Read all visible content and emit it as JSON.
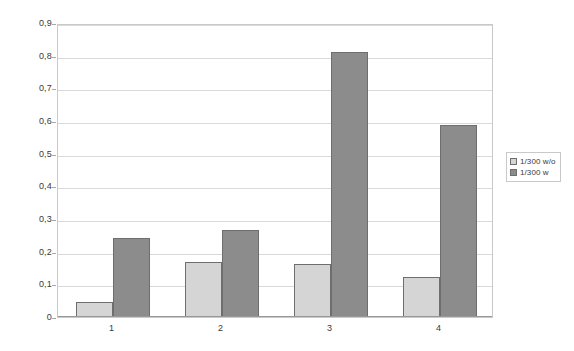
{
  "chart_data": {
    "type": "bar",
    "title": "",
    "subtitle": "",
    "xlabel": "",
    "ylabel": "",
    "categories": [
      "1",
      "2",
      "3",
      "4"
    ],
    "series": [
      {
        "name": "1/300 w/o",
        "color": "#d5d5d5",
        "values": [
          0.046,
          0.168,
          0.162,
          0.123
        ]
      },
      {
        "name": "1/300 w",
        "color": "#8c8c8c",
        "values": [
          0.243,
          0.266,
          0.811,
          0.588
        ]
      }
    ],
    "ylim": [
      0,
      0.9
    ],
    "ytick_labels": [
      "0,9",
      "0,8",
      "0,7",
      "0,6",
      "0,5",
      "0,4",
      "0,3",
      "0,2",
      "0,1",
      "0"
    ],
    "ytick_values": [
      0.9,
      0.8,
      0.7,
      0.6,
      0.5,
      0.4,
      0.3,
      0.2,
      0.1,
      0.0
    ],
    "grid": true,
    "legend_position": "right",
    "decimal_separator": ","
  },
  "colors": {
    "series_0": "#d5d5d5",
    "series_1": "#8c8c8c",
    "bar_border": "#6e6e6e",
    "gridline": "#d9d9d9",
    "plot_border": "#c9c9c9",
    "background": "#ffffff",
    "text": "#3a3a3a"
  }
}
